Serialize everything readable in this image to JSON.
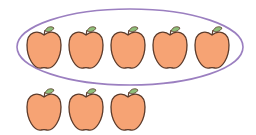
{
  "figure": {
    "grouped_count": 5,
    "ungrouped_count": 3,
    "total_count": 8,
    "colors": {
      "apple_fill": "#F6A374",
      "apple_outline": "#5B3A2A",
      "leaf": "#8FBF7A",
      "stem": "#5B3A2A",
      "ellipse_stroke": "#9B7FC0",
      "background": "#FFFFFF"
    },
    "group_ellipse": {
      "cx": 130,
      "cy": 47,
      "rx": 113,
      "ry": 38
    },
    "apples": [
      {
        "group": "inside",
        "cx": 44,
        "cy": 50
      },
      {
        "group": "inside",
        "cx": 86,
        "cy": 50
      },
      {
        "group": "inside",
        "cx": 128,
        "cy": 50
      },
      {
        "group": "inside",
        "cx": 170,
        "cy": 50
      },
      {
        "group": "inside",
        "cx": 212,
        "cy": 50
      },
      {
        "group": "outside",
        "cx": 44,
        "cy": 112
      },
      {
        "group": "outside",
        "cx": 86,
        "cy": 112
      },
      {
        "group": "outside",
        "cx": 128,
        "cy": 112
      }
    ]
  }
}
